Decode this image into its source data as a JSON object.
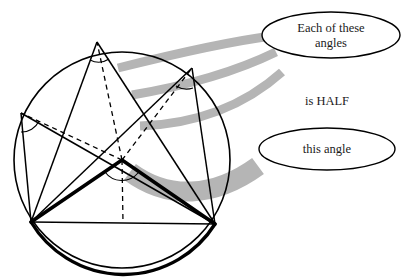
{
  "figure": {
    "background_color": "#ffffff",
    "stroke_color": "#000000",
    "ribbon_color": "#b3b3b3",
    "callouts": [
      {
        "id": "callout-each-angles",
        "line1": "Each of these",
        "line2": "angles",
        "cx": 331,
        "cy": 35,
        "rx": 69,
        "ry": 23
      },
      {
        "id": "callout-this-angle",
        "line1": "this angle",
        "line2": "",
        "cx": 327,
        "cy": 149,
        "rx": 68,
        "ry": 21
      }
    ],
    "free_labels": [
      {
        "id": "label-is-half",
        "text": "is HALF",
        "x": 327,
        "y": 102
      }
    ],
    "circle": {
      "cx": 122,
      "cy": 160,
      "r": 108
    },
    "points": {
      "center": {
        "label": "O",
        "x": 122,
        "y": 160
      },
      "chord_left": {
        "label": "A",
        "x": 31,
        "y": 222
      },
      "chord_right": {
        "label": "B",
        "x": 215,
        "y": 224
      },
      "arc_top": {
        "label": "C",
        "x": 97,
        "y": 42
      },
      "arc_upper_right": {
        "label": "D",
        "x": 192,
        "y": 68
      },
      "arc_left": {
        "label": "E",
        "x": 21,
        "y": 113
      }
    },
    "angle_arcs": [
      {
        "id": "inscribed-angle-top",
        "vertex": "arc_top",
        "radius": 19
      },
      {
        "id": "inscribed-angle-upper-right",
        "vertex": "arc_upper_right",
        "radius": 19
      },
      {
        "id": "inscribed-angle-left",
        "vertex": "arc_left",
        "radius": 19
      },
      {
        "id": "central-angle-center",
        "vertex": "center",
        "radius": 22
      }
    ],
    "ribbons": [
      {
        "id": "ribbon-top",
        "thickness": 9
      },
      {
        "id": "ribbon-middle",
        "thickness": 9
      },
      {
        "id": "ribbon-lower",
        "thickness": 9
      },
      {
        "id": "ribbon-bottom-wide",
        "thickness": 20
      }
    ]
  }
}
